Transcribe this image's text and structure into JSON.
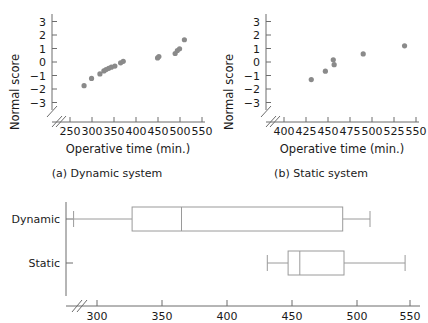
{
  "figure": {
    "panel_a": {
      "caption": "(a) Dynamic system",
      "xlabel": "Operative time (min.)",
      "ylabel": "Normal score",
      "xticks": [
        "250",
        "300",
        "350",
        "400",
        "450",
        "500",
        "550"
      ],
      "yticks": [
        "3",
        "2",
        "1",
        "0",
        "−1",
        "−2",
        "−3"
      ],
      "axis_break": "//"
    },
    "panel_b": {
      "caption": "(b) Static system",
      "xlabel": "Operative time (min.)",
      "ylabel": "Normal score",
      "xticks": [
        "400",
        "425",
        "450",
        "475",
        "500",
        "525",
        "550"
      ],
      "yticks": [
        "3",
        "2",
        "1",
        "0",
        "−1",
        "−2",
        "−3"
      ],
      "axis_break": "//"
    },
    "panel_c": {
      "xticks": [
        "300",
        "350",
        "400",
        "450",
        "500",
        "550"
      ],
      "categories": [
        "Dynamic",
        "Static"
      ],
      "axis_break": "//"
    }
  },
  "chart_data": [
    {
      "type": "scatter",
      "title": "(a) Dynamic system",
      "xlabel": "Operative time (min.)",
      "ylabel": "Normal score",
      "xlim": [
        240,
        560
      ],
      "ylim": [
        -3.5,
        3.5
      ],
      "xticks": [
        250,
        300,
        350,
        400,
        450,
        500,
        550
      ],
      "yticks": [
        -3,
        -2,
        -1,
        0,
        1,
        2,
        3
      ],
      "grid": false,
      "legend": "none",
      "marker_color": "#8a8a8a",
      "x": [
        282,
        299,
        318,
        327,
        332,
        338,
        344,
        352,
        365,
        371,
        449,
        452,
        489,
        494,
        499,
        510
      ],
      "y": [
        -1.75,
        -1.22,
        -0.88,
        -0.66,
        -0.56,
        -0.47,
        -0.38,
        -0.3,
        -0.06,
        0.05,
        0.3,
        0.4,
        0.63,
        0.85,
        0.98,
        1.65
      ]
    },
    {
      "type": "scatter",
      "title": "(b) Static system",
      "xlabel": "Operative time (min.)",
      "ylabel": "Normal score",
      "xlim": [
        392,
        562
      ],
      "ylim": [
        -3.5,
        3.5
      ],
      "xticks": [
        400,
        425,
        450,
        475,
        500,
        525,
        550
      ],
      "yticks": [
        -3,
        -2,
        -1,
        0,
        1,
        2,
        3
      ],
      "grid": false,
      "legend": "none",
      "marker_color": "#8a8a8a",
      "x": [
        431,
        447,
        456,
        457,
        490,
        537
      ],
      "y": [
        -1.3,
        -0.68,
        0.16,
        -0.2,
        0.6,
        1.2
      ]
    },
    {
      "type": "boxplot",
      "orientation": "horizontal",
      "xlabel": "",
      "ylabel": "",
      "xlim": [
        288,
        562
      ],
      "xticks": [
        300,
        350,
        400,
        450,
        500,
        550
      ],
      "grid": false,
      "legend": "none",
      "categories": [
        "Dynamic",
        "Static"
      ],
      "boxes": [
        {
          "name": "Dynamic",
          "whisker_low": 282,
          "q1": 327,
          "median": 365,
          "q3": 489,
          "whisker_high": 510
        },
        {
          "name": "Static",
          "whisker_low": 431,
          "q1": 447,
          "median": 456,
          "q3": 490,
          "whisker_high": 537
        }
      ]
    }
  ]
}
